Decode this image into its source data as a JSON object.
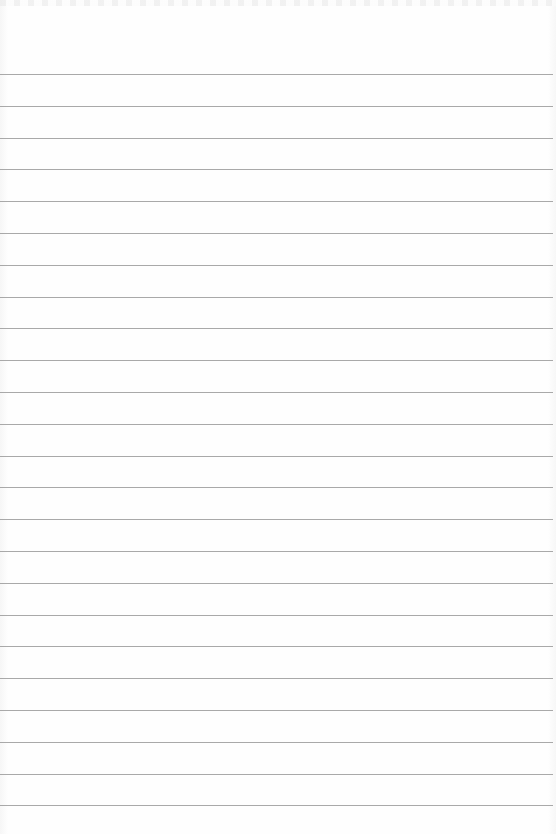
{
  "page": {
    "type": "blank-lined-paper",
    "line_color": "#9a9a9a",
    "background_color": "#fdfdfd",
    "first_line_y": 74,
    "line_spacing": 31.8,
    "line_count": 24
  }
}
